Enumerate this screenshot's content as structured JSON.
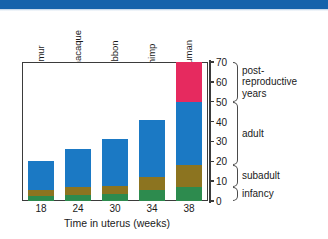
{
  "figure": {
    "banner_color": "#1663ab"
  },
  "chart_data": {
    "type": "bar",
    "title": "",
    "subtitle": "",
    "xlabel": "Time in uterus (weeks)",
    "ylabel": "",
    "ylim": [
      0,
      70
    ],
    "yticks": [
      0,
      10,
      20,
      30,
      40,
      50,
      60,
      70
    ],
    "grid": false,
    "legend_position": "right-brackets",
    "stacked": true,
    "categories": [
      "lemur",
      "macaque",
      "gibbon",
      "chimp",
      "human"
    ],
    "x": [
      18,
      24,
      30,
      34,
      38
    ],
    "xtick_labels": [
      "18",
      "24",
      "30",
      "34",
      "38"
    ],
    "series": [
      {
        "name": "infancy",
        "color": "#2d8b4e",
        "values": [
          2.5,
          3,
          3.5,
          5.5,
          7
        ]
      },
      {
        "name": "subadult",
        "color": "#8c7420",
        "values": [
          3,
          4,
          4,
          6.5,
          11
        ]
      },
      {
        "name": "adult",
        "color": "#1b79c4",
        "values": [
          14.5,
          19,
          23.5,
          29,
          32
        ]
      },
      {
        "name": "post-reproductive years",
        "color": "#e62a5f",
        "values": [
          0,
          0,
          0,
          0,
          20
        ]
      }
    ],
    "totals": [
      20,
      26,
      31,
      41,
      70
    ],
    "annotations": [
      {
        "label": "post-\nreproductive\nyears",
        "range": [
          50,
          70
        ]
      },
      {
        "label": "adult",
        "range": [
          18,
          50
        ]
      },
      {
        "label": "subadult",
        "range": [
          7,
          18
        ]
      },
      {
        "label": "infancy",
        "range": [
          0,
          7
        ]
      }
    ]
  },
  "axis": {
    "y_tick_labels": [
      "0",
      "10",
      "20",
      "30",
      "40",
      "50",
      "60",
      "70"
    ],
    "x_tick_labels": [
      "18",
      "24",
      "30",
      "34",
      "38"
    ],
    "x_title": "Time in uterus (weeks)"
  },
  "species": [
    {
      "label": "lemur"
    },
    {
      "label": "macaque"
    },
    {
      "label": "gibbon"
    },
    {
      "label": "chimp"
    },
    {
      "label": "human"
    }
  ],
  "stages": [
    {
      "label": "post-\nreproductive\nyears"
    },
    {
      "label": "adult"
    },
    {
      "label": "subadult"
    },
    {
      "label": "infancy"
    }
  ]
}
